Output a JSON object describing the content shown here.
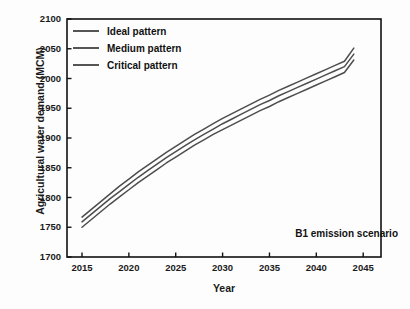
{
  "chart_data": {
    "type": "line",
    "title": "",
    "xlabel": "Year",
    "ylabel": "Agricultural water demand (MCM)",
    "xlim": [
      2013.4,
      2046.9
    ],
    "ylim": [
      1700,
      2100
    ],
    "xticks": [
      2015,
      2020,
      2025,
      2030,
      2035,
      2040,
      2045
    ],
    "yticks": [
      1700,
      1750,
      1800,
      1850,
      1900,
      1950,
      2000,
      2050,
      2100
    ],
    "grid": false,
    "legend_position": "top-left",
    "annotation": "B1 emission scenario",
    "x": [
      2015,
      2016,
      2017,
      2018,
      2019,
      2020,
      2021,
      2022,
      2023,
      2024,
      2025,
      2026,
      2027,
      2028,
      2029,
      2030,
      2031,
      2032,
      2033,
      2034,
      2035,
      2036,
      2037,
      2038,
      2039,
      2040,
      2041,
      2042,
      2043,
      2044
    ],
    "series": [
      {
        "name": "Ideal pattern",
        "color": "#4d4d4d",
        "values": [
          1767,
          1780,
          1793,
          1806,
          1819,
          1831,
          1843,
          1854,
          1865,
          1876,
          1886,
          1896,
          1906,
          1915,
          1924,
          1933,
          1941,
          1949,
          1957,
          1965,
          1972,
          1980,
          1987,
          1994,
          2001,
          2008,
          2015,
          2022,
          2029,
          2051
        ]
      },
      {
        "name": "Medium pattern",
        "color": "#4d4d4d",
        "values": [
          1759,
          1772,
          1785,
          1798,
          1810,
          1822,
          1834,
          1845,
          1856,
          1867,
          1877,
          1887,
          1897,
          1906,
          1915,
          1924,
          1932,
          1940,
          1948,
          1956,
          1963,
          1971,
          1978,
          1985,
          1992,
          1999,
          2006,
          2013,
          2020,
          2041
        ]
      },
      {
        "name": "Critical pattern",
        "color": "#4d4d4d",
        "values": [
          1750,
          1763,
          1776,
          1789,
          1801,
          1813,
          1825,
          1836,
          1847,
          1858,
          1868,
          1878,
          1888,
          1897,
          1906,
          1914,
          1922,
          1930,
          1938,
          1946,
          1953,
          1961,
          1968,
          1975,
          1982,
          1989,
          1996,
          2003,
          2010,
          2031
        ]
      }
    ]
  },
  "legend": {
    "items": [
      {
        "label": "Ideal pattern"
      },
      {
        "label": "Medium pattern"
      },
      {
        "label": "Critical pattern"
      }
    ]
  },
  "annotation": {
    "text": "B1 emission scenario"
  },
  "axes": {
    "xlabel": "Year",
    "ylabel": "Agricultural water demand (MCM)"
  },
  "colors": {
    "line": "#4d4d4d",
    "axis": "#111111",
    "text": "#111111",
    "background": "#fdfdfd"
  }
}
